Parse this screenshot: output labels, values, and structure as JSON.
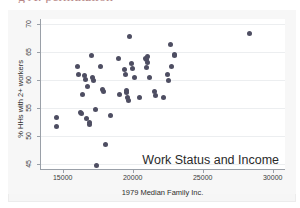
{
  "document": {
    "cut_off_heading": "g A: permutation"
  },
  "chart_data": {
    "type": "scatter",
    "title": "",
    "annotation": "Work Status and Income",
    "xlabel": "1979 Median Family Inc.",
    "ylabel": "% HHs with 2+ workers",
    "xlim": [
      13450,
      30950
    ],
    "ylim": [
      44.0,
      70.9
    ],
    "xticks": [
      15000,
      20000,
      25000,
      30000
    ],
    "xtick_labels": [
      "15000",
      "20000",
      "25000",
      "30000"
    ],
    "yticks": [
      45,
      50,
      55,
      60,
      65,
      70
    ],
    "ytick_labels": [
      "45",
      "50",
      "55",
      "60",
      "65",
      "70"
    ],
    "grid": "horizontal",
    "legend": "none",
    "marker_color": "#4e4e62",
    "points": [
      {
        "x": 14580,
        "y": 53.4
      },
      {
        "x": 14560,
        "y": 51.8
      },
      {
        "x": 16030,
        "y": 62.5
      },
      {
        "x": 16110,
        "y": 61.1
      },
      {
        "x": 16290,
        "y": 54.3
      },
      {
        "x": 16370,
        "y": 54.1
      },
      {
        "x": 16430,
        "y": 57.4
      },
      {
        "x": 16540,
        "y": 60.9
      },
      {
        "x": 16620,
        "y": 60.1
      },
      {
        "x": 16700,
        "y": 53.1
      },
      {
        "x": 16760,
        "y": 58.9
      },
      {
        "x": 16900,
        "y": 52.4
      },
      {
        "x": 16920,
        "y": 52.1
      },
      {
        "x": 17060,
        "y": 64.4
      },
      {
        "x": 17120,
        "y": 60.4
      },
      {
        "x": 17190,
        "y": 59.9
      },
      {
        "x": 17330,
        "y": 54.8
      },
      {
        "x": 17380,
        "y": 44.8
      },
      {
        "x": 17720,
        "y": 62.5
      },
      {
        "x": 17810,
        "y": 58.4
      },
      {
        "x": 17940,
        "y": 58.0
      },
      {
        "x": 18080,
        "y": 48.6
      },
      {
        "x": 18390,
        "y": 53.7
      },
      {
        "x": 18970,
        "y": 63.8
      },
      {
        "x": 19040,
        "y": 57.4
      },
      {
        "x": 19420,
        "y": 61.9
      },
      {
        "x": 19480,
        "y": 61.1
      },
      {
        "x": 19560,
        "y": 57.8
      },
      {
        "x": 19580,
        "y": 58.1
      },
      {
        "x": 19660,
        "y": 56.9
      },
      {
        "x": 19680,
        "y": 56.4
      },
      {
        "x": 19790,
        "y": 67.7
      },
      {
        "x": 19930,
        "y": 62.9
      },
      {
        "x": 19980,
        "y": 62.1
      },
      {
        "x": 20100,
        "y": 60.5
      },
      {
        "x": 20480,
        "y": 57.0
      },
      {
        "x": 20900,
        "y": 63.9
      },
      {
        "x": 20950,
        "y": 63.6
      },
      {
        "x": 20990,
        "y": 62.3
      },
      {
        "x": 21030,
        "y": 64.2
      },
      {
        "x": 21080,
        "y": 63.1
      },
      {
        "x": 21190,
        "y": 60.4
      },
      {
        "x": 21580,
        "y": 58.0
      },
      {
        "x": 21640,
        "y": 57.3
      },
      {
        "x": 22190,
        "y": 56.9
      },
      {
        "x": 22460,
        "y": 61.1
      },
      {
        "x": 22540,
        "y": 60.0
      },
      {
        "x": 22680,
        "y": 66.3
      },
      {
        "x": 22760,
        "y": 62.5
      },
      {
        "x": 22960,
        "y": 64.6
      },
      {
        "x": 22990,
        "y": 64.4
      },
      {
        "x": 28330,
        "y": 68.3
      }
    ]
  }
}
